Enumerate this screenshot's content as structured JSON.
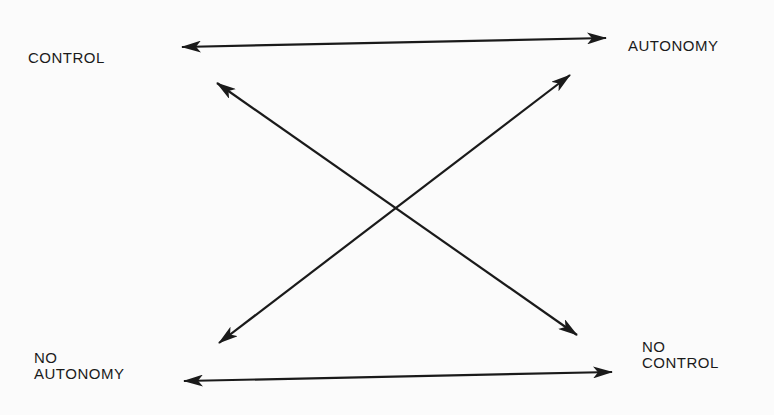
{
  "diagram": {
    "nodes": [
      {
        "id": "control",
        "lines": [
          "CONTROL"
        ]
      },
      {
        "id": "autonomy",
        "lines": [
          "AUTONOMY"
        ]
      },
      {
        "id": "no_autonomy",
        "lines": [
          "NO",
          "AUTONOMY"
        ]
      },
      {
        "id": "no_control",
        "lines": [
          "NO",
          "CONTROL"
        ]
      }
    ],
    "edges": [
      {
        "from": "control",
        "to": "autonomy",
        "type": "bidirectional"
      },
      {
        "from": "no_autonomy",
        "to": "no_control",
        "type": "bidirectional"
      },
      {
        "from": "control",
        "to": "no_control",
        "type": "bidirectional"
      },
      {
        "from": "autonomy",
        "to": "no_autonomy",
        "type": "bidirectional"
      }
    ],
    "colors": {
      "ink": "#1a1a1a",
      "background": "#fbfbfb"
    }
  }
}
